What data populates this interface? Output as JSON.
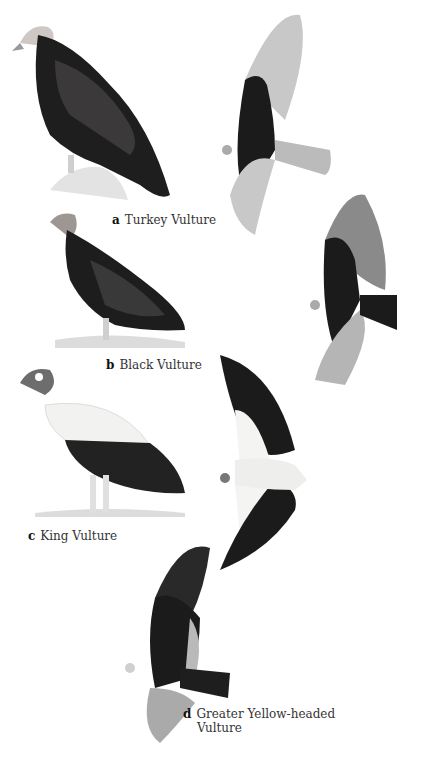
{
  "plate": {
    "species": [
      {
        "letter": "a",
        "name": "Turkey Vulture"
      },
      {
        "letter": "b",
        "name": "Black Vulture"
      },
      {
        "letter": "c",
        "name": "King Vulture"
      },
      {
        "letter": "d",
        "name": "Greater Yellow-headed",
        "name_line2": "Vulture"
      }
    ]
  },
  "colors": {
    "plumage_dark": "#1c1b1b",
    "plumage_mid": "#3a3838",
    "flight_feathers_light": "#bdbdbd",
    "king_white": "#f2f2f0",
    "ground": "#d9d9d9",
    "background": "#ffffff"
  }
}
